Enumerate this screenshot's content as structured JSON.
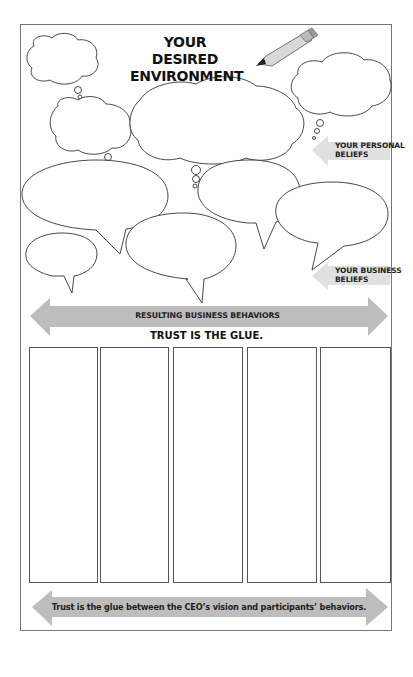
{
  "header": {
    "title_line1": "YOUR DESIRED",
    "title_line2": "ENVIRONMENT",
    "icon": "pencil-icon"
  },
  "labels": {
    "personal_beliefs_line1": "YOUR PERSONAL",
    "personal_beliefs_line2": "BELIEFS",
    "business_beliefs_line1": "YOUR BUSINESS",
    "business_beliefs_line2": "BELIEFS"
  },
  "bands": {
    "behaviors": "RESULTING BUSINESS BEHAVIORS",
    "trust_caption": "TRUST IS THE GLUE.",
    "footer": "Trust is the glue between the CEO’s vision and participants’ behaviors."
  },
  "columns": [
    {
      "id": 1,
      "content": ""
    },
    {
      "id": 2,
      "content": ""
    },
    {
      "id": 3,
      "content": ""
    },
    {
      "id": 4,
      "content": ""
    },
    {
      "id": 5,
      "content": ""
    }
  ],
  "colors": {
    "arrow_fill": "#bdbdbd",
    "label_arrow_fill": "#e0e0e0",
    "outline": "#333333",
    "frame": "#777777"
  }
}
